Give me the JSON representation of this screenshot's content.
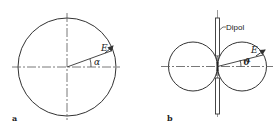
{
  "panels": [
    {
      "id": "a",
      "label": "a",
      "description": "Isotropic radiation pattern (circle)",
      "vector_label": "E",
      "angle_label": "α"
    },
    {
      "id": "b",
      "label": "b",
      "description": "Dipole radiation pattern (figure-eight)",
      "vector_label": "E",
      "angle_label": "ϑ",
      "dipole_label": "Dipol"
    }
  ],
  "colors": {
    "stroke": "#333333",
    "background": "#ffffff"
  }
}
